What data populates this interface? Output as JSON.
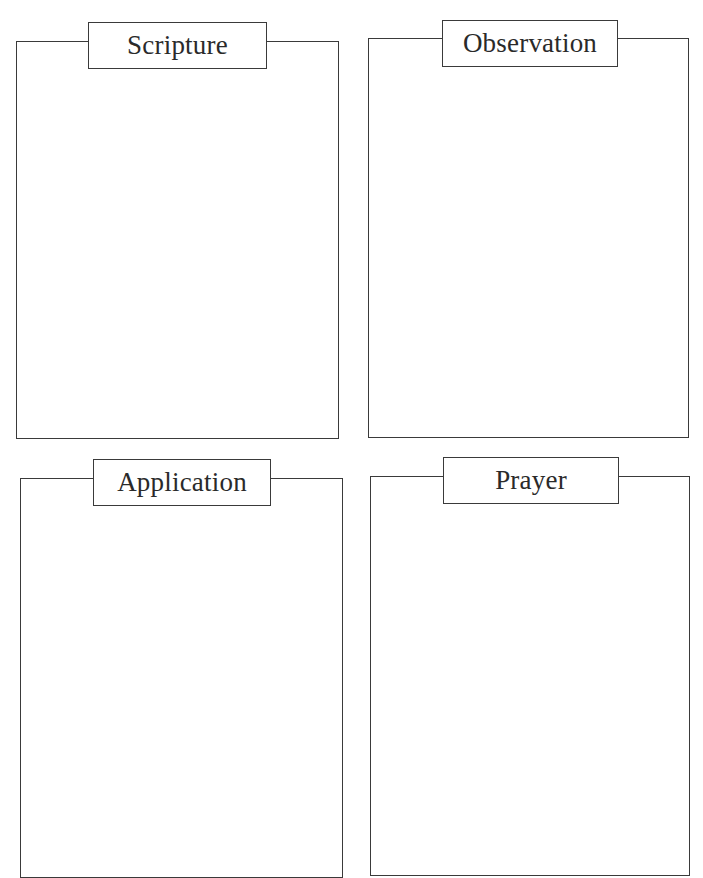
{
  "worksheet": {
    "panels": [
      {
        "id": "scripture",
        "label": "Scripture"
      },
      {
        "id": "observation",
        "label": "Observation"
      },
      {
        "id": "application",
        "label": "Application"
      },
      {
        "id": "prayer",
        "label": "Prayer"
      }
    ]
  },
  "colors": {
    "line": "#3a3a3a",
    "text": "#2a2a2a",
    "background": "#ffffff"
  }
}
